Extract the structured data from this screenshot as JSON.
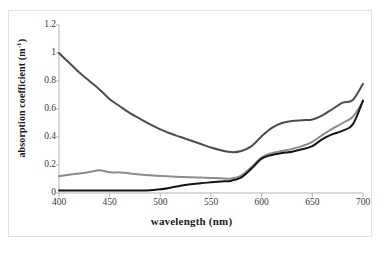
{
  "chart_data": {
    "type": "line",
    "title": "",
    "xlabel": "wavelength  (nm)",
    "ylabel": "absorption coefficient (m-1)",
    "ylabel_base": "absorption coefficient (m",
    "ylabel_sup": "-1",
    "ylabel_tail": ")",
    "xlim": [
      400,
      700
    ],
    "ylim": [
      0,
      1.2
    ],
    "xticks": [
      400,
      450,
      500,
      550,
      600,
      650,
      700
    ],
    "yticks": [
      0,
      0.2,
      0.4,
      0.6,
      0.8,
      1,
      1.2
    ],
    "ytick_labels": [
      "0",
      "0.2",
      "0.4",
      "0.6",
      "0.8",
      "1",
      "1.2"
    ],
    "xtick_labels": [
      "400",
      "450",
      "500",
      "550",
      "600",
      "650",
      "700"
    ],
    "grid": false,
    "legend": "none",
    "x": [
      400,
      410,
      420,
      430,
      440,
      450,
      460,
      470,
      480,
      490,
      500,
      510,
      520,
      530,
      540,
      550,
      560,
      570,
      580,
      590,
      600,
      610,
      620,
      630,
      640,
      650,
      660,
      670,
      680,
      690,
      700
    ],
    "series": [
      {
        "name": "upper-curve",
        "color": "#4d4d4d",
        "width": 2.0,
        "values": [
          1.0,
          0.93,
          0.86,
          0.8,
          0.74,
          0.67,
          0.62,
          0.57,
          0.53,
          0.49,
          0.455,
          0.425,
          0.4,
          0.375,
          0.35,
          0.325,
          0.305,
          0.292,
          0.3,
          0.335,
          0.405,
          0.465,
          0.5,
          0.515,
          0.52,
          0.525,
          0.555,
          0.6,
          0.645,
          0.665,
          0.78
        ]
      },
      {
        "name": "middle-curve",
        "color": "#8c8c8c",
        "width": 2.0,
        "values": [
          0.12,
          0.13,
          0.14,
          0.15,
          0.163,
          0.148,
          0.147,
          0.14,
          0.132,
          0.126,
          0.122,
          0.118,
          0.115,
          0.112,
          0.11,
          0.108,
          0.105,
          0.103,
          0.125,
          0.185,
          0.255,
          0.285,
          0.3,
          0.315,
          0.335,
          0.365,
          0.415,
          0.46,
          0.5,
          0.545,
          0.655
        ]
      },
      {
        "name": "lower-curve",
        "color": "#141414",
        "width": 2.0,
        "values": [
          0.018,
          0.018,
          0.018,
          0.018,
          0.018,
          0.018,
          0.018,
          0.018,
          0.018,
          0.02,
          0.026,
          0.038,
          0.052,
          0.062,
          0.07,
          0.076,
          0.082,
          0.088,
          0.112,
          0.175,
          0.245,
          0.272,
          0.285,
          0.295,
          0.312,
          0.335,
          0.385,
          0.42,
          0.445,
          0.49,
          0.66
        ]
      }
    ]
  },
  "axis": {
    "spine_color": "#b3b3b3",
    "tick_color": "#b3b3b3",
    "frame_color": "#e2e2e2"
  }
}
